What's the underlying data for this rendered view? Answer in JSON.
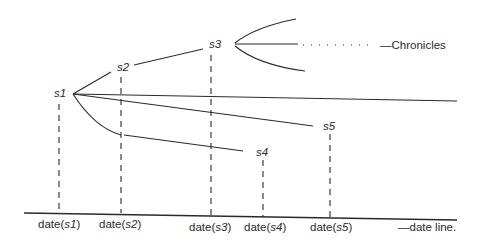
{
  "diagram": {
    "states": [
      {
        "id": "s1",
        "label": "s1"
      },
      {
        "id": "s2",
        "label": "s2"
      },
      {
        "id": "s3",
        "label": "s3"
      },
      {
        "id": "s4",
        "label": "s4"
      },
      {
        "id": "s5",
        "label": "s5"
      }
    ],
    "chronicles_label": "—Chronicles",
    "date_line_label": "—date line.",
    "dates": [
      {
        "prefix": "date(",
        "state": "s1",
        "suffix": ")"
      },
      {
        "prefix": "date(",
        "state": "s2",
        "suffix": ")"
      },
      {
        "prefix": "date(",
        "state": "s3",
        "suffix": ")"
      },
      {
        "prefix": "date(",
        "state": "s4",
        "suffix": ")"
      },
      {
        "prefix": "date(",
        "state": "s5",
        "suffix": ")"
      }
    ],
    "colors": {
      "ink": "#2a2a2a",
      "background": "#ffffff"
    }
  }
}
